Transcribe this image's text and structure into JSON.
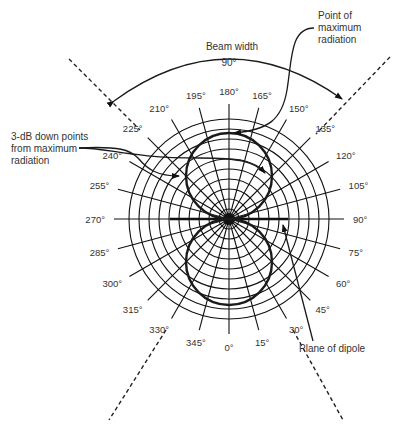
{
  "diagram": {
    "center": {
      "x": 229,
      "y": 219
    },
    "grid": {
      "ring_count": 10,
      "ring_spacing": 10,
      "spoke_step_deg": 15,
      "spoke_length": 115,
      "label_radius": 128
    },
    "angle_labels": [
      {
        "deg": 0,
        "text": "0°"
      },
      {
        "deg": 15,
        "text": "15°"
      },
      {
        "deg": 30,
        "text": "30°"
      },
      {
        "deg": 45,
        "text": "45°"
      },
      {
        "deg": 60,
        "text": "60°"
      },
      {
        "deg": 75,
        "text": "75°"
      },
      {
        "deg": 90,
        "text": "90°"
      },
      {
        "deg": 105,
        "text": "105°"
      },
      {
        "deg": 120,
        "text": "120°"
      },
      {
        "deg": 135,
        "text": "135°"
      },
      {
        "deg": 150,
        "text": "150°"
      },
      {
        "deg": 165,
        "text": "165°"
      },
      {
        "deg": 180,
        "text": "180°"
      },
      {
        "deg": 195,
        "text": "195°"
      },
      {
        "deg": 210,
        "text": "210°"
      },
      {
        "deg": 225,
        "text": "225°"
      },
      {
        "deg": 240,
        "text": "240°"
      },
      {
        "deg": 255,
        "text": "255°"
      },
      {
        "deg": 270,
        "text": "270°"
      },
      {
        "deg": 285,
        "text": "285°"
      },
      {
        "deg": 300,
        "text": "300°"
      },
      {
        "deg": 315,
        "text": "315°"
      },
      {
        "deg": 330,
        "text": "330°"
      },
      {
        "deg": 345,
        "text": "345°"
      }
    ],
    "lobe_radius": 43,
    "beam_width": {
      "label": "Beam width",
      "value": "90°"
    },
    "annotations": {
      "max_radiation": [
        "Point of",
        "maximum",
        "radiation"
      ],
      "three_db": [
        "3-dB down points",
        "from maximum",
        "radiation"
      ],
      "plane": "Plane of dipole"
    },
    "colors": {
      "line": "#111111",
      "text": "#333333",
      "background": "#ffffff"
    }
  }
}
